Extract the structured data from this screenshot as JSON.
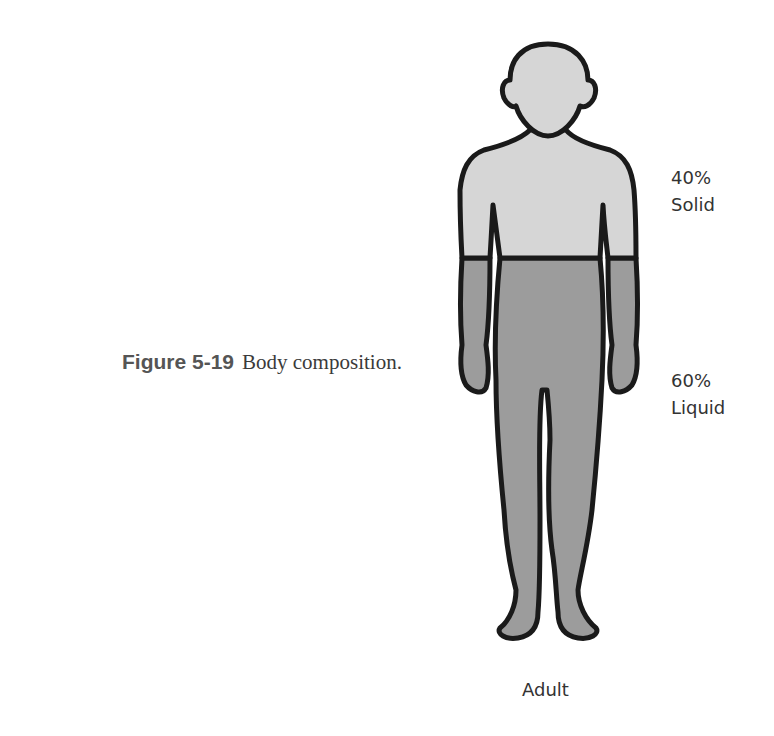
{
  "caption": {
    "figure_number": "Figure 5-19",
    "text": "Body composition."
  },
  "labels": {
    "solid_percent": "40%",
    "solid_text": "Solid",
    "liquid_percent": "60%",
    "liquid_text": "Liquid",
    "subject": "Adult"
  },
  "colors": {
    "solid_fill": "#d6d6d6",
    "liquid_fill": "#9c9c9c",
    "outline": "#1a1a1a"
  }
}
